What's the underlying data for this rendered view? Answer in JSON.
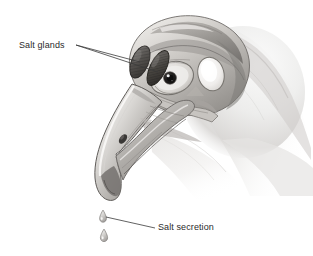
{
  "figure": {
    "kind": "anatomical-illustration",
    "background_color": "#ffffff",
    "width": 313,
    "height": 256
  },
  "labels": {
    "salt_glands": {
      "text": "Salt glands",
      "x": 19,
      "y": 40,
      "leader_lines": 2
    },
    "salt_secretion": {
      "text": "Salt secretion",
      "x": 158,
      "y": 222,
      "leader_lines": 1
    }
  },
  "colors": {
    "ink": "#2b2b2b",
    "leader": "#3a3a3a",
    "bone_light": "#e8e6e3",
    "bone_mid": "#c3c0bc",
    "bone_dark": "#8f8c89",
    "gland_dark": "#55524f",
    "gland_darkest": "#3b3836",
    "soft_tissue": "#dedcda",
    "pupil": "#1a1a1a",
    "highlight": "#ffffff",
    "beak_shadow": "#6e6b68"
  },
  "parts": {
    "cranium": "cranium",
    "salt_gland_upper": "salt-gland-upper",
    "salt_gland_lower": "salt-gland-lower",
    "eye": "eye",
    "orbit": "orbit",
    "nostril": "nostril",
    "upper_beak": "upper-beak",
    "lower_beak": "lower-beak",
    "neck": "neck",
    "droplet_upper": "droplet-upper",
    "droplet_lower": "droplet-lower"
  }
}
